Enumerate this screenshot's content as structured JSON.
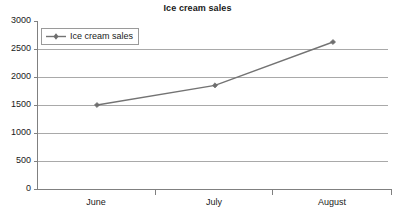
{
  "chart_data": {
    "type": "line",
    "title": "Ice cream sales",
    "xlabel": "",
    "ylabel": "",
    "categories": [
      "June",
      "July",
      "August"
    ],
    "series": [
      {
        "name": "Ice cream sales",
        "values": [
          1500,
          1850,
          2625
        ],
        "color": "#737373",
        "marker": "diamond"
      }
    ],
    "ylim": [
      0,
      3000
    ],
    "yticks": [
      0,
      500,
      1000,
      1500,
      2000,
      2500,
      3000
    ],
    "ytick_labels": [
      "0",
      "500",
      "1000",
      "1500",
      "2000",
      "2500",
      "3000"
    ],
    "grid": true,
    "grid_axis": "y",
    "legend": {
      "position": "top-left-inside",
      "entries": [
        "Ice cream sales"
      ]
    }
  },
  "axes": {
    "y_labels": {
      "t0": "3000",
      "t1": "2500",
      "t2": "2000",
      "t3": "1500",
      "t4": "1000",
      "t5": "500",
      "t6": "0"
    },
    "x_labels": {
      "c0": "June",
      "c1": "July",
      "c2": "August"
    }
  },
  "legend": {
    "entry_label": "Ice cream sales"
  }
}
